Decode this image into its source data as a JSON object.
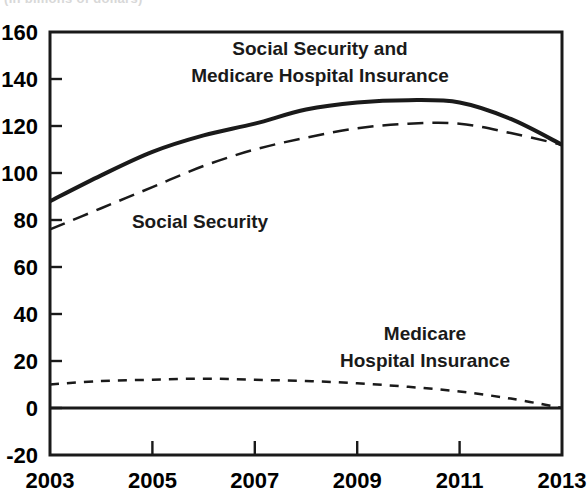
{
  "figure": {
    "clipped_header_text": "(In billions of dollars)",
    "background_color": "#ffffff",
    "line_color": "#1a1a1a"
  },
  "annotations": [
    {
      "id": "combined",
      "line1": "Social Security and",
      "line2": "Medicare Hospital Insurance",
      "x": 320,
      "y": 55
    },
    {
      "id": "social-security",
      "line1": "Social Security",
      "line2": "",
      "x": 200,
      "y": 228
    },
    {
      "id": "medicare-hi",
      "line1": "Medicare",
      "line2": "Hospital Insurance",
      "x": 425,
      "y": 340
    }
  ],
  "axes": {
    "y_ticks": [
      "160",
      "140",
      "120",
      "100",
      "80",
      "60",
      "40",
      "20",
      "0",
      "-20"
    ],
    "x_ticks": [
      "2003",
      "2005",
      "2007",
      "2009",
      "2011",
      "2013"
    ],
    "ylim": [
      -20,
      160
    ],
    "xlim": [
      2003,
      2013
    ],
    "ylabel": "",
    "xlabel": ""
  },
  "chart_data": {
    "type": "line",
    "subtitle": "",
    "xlabel": "",
    "ylabel": "",
    "xlim": [
      2003,
      2013
    ],
    "ylim": [
      -20,
      160
    ],
    "grid": false,
    "legend": "inline-annotations",
    "x": [
      2003,
      2004,
      2005,
      2006,
      2007,
      2008,
      2009,
      2010,
      2011,
      2012,
      2013
    ],
    "series": [
      {
        "name": "Social Security and Medicare Hospital Insurance",
        "style": "solid",
        "linewidth": 4,
        "values": [
          88,
          99,
          109,
          116,
          121,
          127,
          130,
          131,
          130,
          123,
          112
        ]
      },
      {
        "name": "Social Security",
        "style": "dashed",
        "linewidth": 2.5,
        "values": [
          76,
          85,
          94,
          103,
          110,
          115,
          119,
          121,
          121,
          117,
          112
        ]
      },
      {
        "name": "Medicare Hospital Insurance",
        "style": "dotted",
        "linewidth": 2.5,
        "values": [
          10,
          11.5,
          12,
          12.5,
          12,
          11.5,
          10.5,
          9,
          7,
          4,
          0
        ]
      }
    ]
  }
}
